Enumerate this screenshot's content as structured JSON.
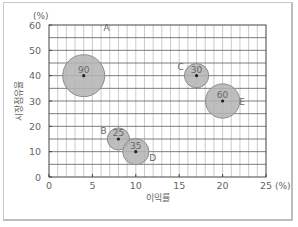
{
  "chart_data": {
    "type": "scatter",
    "subtype": "bubble",
    "title": "",
    "xlabel": "이익률",
    "ylabel": "시장점유율",
    "x_unit": "(%)",
    "y_unit": "(%)",
    "xlim": [
      0,
      25
    ],
    "ylim": [
      0,
      60
    ],
    "x_ticks": [
      0,
      5,
      10,
      15,
      20,
      25
    ],
    "y_ticks": [
      0,
      10,
      20,
      30,
      40,
      50,
      60
    ],
    "x_tick_labels": [
      "0",
      "5",
      "10",
      "15",
      "20",
      "25"
    ],
    "y_tick_labels": [
      "0",
      "10",
      "20",
      "30",
      "40",
      "50",
      "60"
    ],
    "grid": {
      "vertical_step": 1,
      "horizontal_step": 5
    },
    "legend": "none",
    "points": [
      {
        "name": "A",
        "x": 4,
        "y": 40,
        "size": 90
      },
      {
        "name": "B",
        "x": 8,
        "y": 15,
        "size": 25
      },
      {
        "name": "C",
        "x": 17,
        "y": 40,
        "size": 30
      },
      {
        "name": "D",
        "x": 10,
        "y": 10,
        "size": 35
      },
      {
        "name": "E",
        "x": 20,
        "y": 30,
        "size": 60
      }
    ],
    "colors": {
      "bubble_fill": "#b3b3b3",
      "bubble_stroke": "#8c8c8c",
      "grid": "#9a9a9a",
      "axis": "#444444"
    }
  }
}
